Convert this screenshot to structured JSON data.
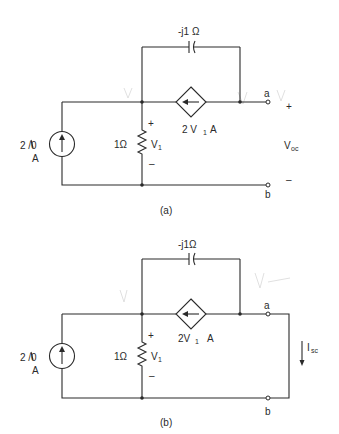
{
  "figure": {
    "circuits": [
      {
        "id": "a",
        "caption": "(a)",
        "capacitor_label": "-j1 Ω",
        "source_label_top": "2 /0",
        "source_label_bottom": "A",
        "resistor_label": "1Ω",
        "v1_label": "V",
        "v1_sub": "1",
        "v1_plus": "+",
        "v1_minus": "–",
        "dep_source_label": "2 V",
        "dep_source_sub": "1",
        "dep_source_unit": "A",
        "terminal_a": "a",
        "terminal_b": "b",
        "output_plus": "+",
        "output_minus": "–",
        "output_label": "V",
        "output_sub": "oc"
      },
      {
        "id": "b",
        "caption": "(b)",
        "capacitor_label": "-j1Ω",
        "source_label_top": "2 /0",
        "source_label_bottom": "A",
        "resistor_label": "1Ω",
        "v1_label": "V",
        "v1_sub": "1",
        "v1_plus": "+",
        "v1_minus": "–",
        "dep_source_label": "2V",
        "dep_source_sub": "1",
        "dep_source_unit": "A",
        "terminal_a": "a",
        "terminal_b": "b",
        "output_label": "I",
        "output_sub": "sc"
      }
    ]
  }
}
